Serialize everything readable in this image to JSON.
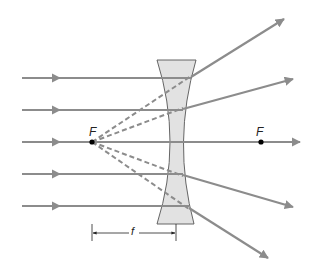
{
  "diagram": {
    "colors": {
      "ray": "#8c8c8c",
      "lens_fill": "#e2e2e2",
      "lens_stroke": "#555555",
      "focal_point": "#000000",
      "text": "#222222"
    },
    "labels": {
      "focal_left": "F",
      "focal_right": "F",
      "focal_length": "f"
    },
    "incoming_rays": [
      {
        "y": 78
      },
      {
        "y": 110
      },
      {
        "y": 142
      },
      {
        "y": 174
      },
      {
        "y": 206
      }
    ],
    "outgoing_rays": [
      {
        "from": [
          191,
          76
        ],
        "to": [
          284,
          19
        ]
      },
      {
        "from": [
          183,
          108
        ],
        "to": [
          293,
          79
        ]
      },
      {
        "from": [
          178,
          142
        ],
        "to": [
          300,
          142
        ]
      },
      {
        "from": [
          183,
          176
        ],
        "to": [
          293,
          207
        ]
      },
      {
        "from": [
          189,
          209
        ],
        "to": [
          268,
          258
        ]
      }
    ],
    "virtual_extensions": [
      {
        "from": [
          92,
          142
        ],
        "to": [
          191,
          76
        ]
      },
      {
        "from": [
          92,
          142
        ],
        "to": [
          183,
          108
        ]
      },
      {
        "from": [
          92,
          142
        ],
        "to": [
          183,
          176
        ]
      },
      {
        "from": [
          92,
          142
        ],
        "to": [
          189,
          209
        ]
      }
    ],
    "focal_points": [
      {
        "x": 92,
        "y": 142
      },
      {
        "x": 261,
        "y": 142
      }
    ],
    "focal_length_marker": {
      "x1": 92,
      "x2": 176,
      "y": 233
    }
  }
}
